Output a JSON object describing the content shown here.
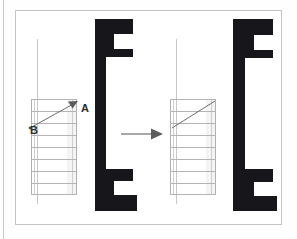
{
  "figure": {
    "title": "Stair flight section transformation",
    "background_color": "#ffffff",
    "frame_color": "#c4c4c4",
    "profile_fill": "#17161a",
    "line_color": "#b4b4b4",
    "label_color": "#2b2b2b"
  },
  "labels": {
    "point_a": "A",
    "point_b": "B"
  },
  "panels": [
    {
      "id": "before",
      "name": "before-state",
      "ladder": {
        "rung_count": 8,
        "has_vector": true,
        "vector_from": "B",
        "vector_to": "A",
        "labels_visible": true
      },
      "profile": {
        "name": "c-channel-profile",
        "shape": "bracket",
        "notch_top": true,
        "notch_bottom": true
      }
    },
    {
      "id": "after",
      "name": "after-state",
      "ladder": {
        "rung_count": 8,
        "has_vector": true,
        "vector_from": "B",
        "vector_to": "A",
        "labels_visible": false
      },
      "profile": {
        "name": "c-channel-profile",
        "shape": "bracket",
        "notch_top": true,
        "notch_bottom": true
      }
    }
  ],
  "transform_arrow": {
    "name": "transformation-arrow",
    "direction": "right",
    "caption": ""
  }
}
